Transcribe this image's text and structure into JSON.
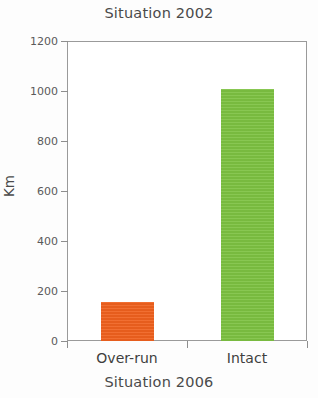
{
  "chart_data": {
    "type": "bar",
    "title": "Situation 2002",
    "xlabel": "Situation 2006",
    "ylabel": "Km",
    "categories": [
      "Over-run",
      "Intact"
    ],
    "values": [
      155,
      1010
    ],
    "colors": [
      "#F0611E",
      "#7DC242"
    ],
    "ylim": [
      0,
      1200
    ],
    "ytick_labels": [
      "0",
      "200",
      "400",
      "600",
      "800",
      "1000",
      "1200"
    ],
    "ytick_values": [
      0,
      200,
      400,
      600,
      800,
      1000,
      1200
    ],
    "grid": false,
    "legend": "none",
    "frame_color": "#9a9a9a",
    "text_color": "#4a4a4a",
    "background": "#ffffff"
  }
}
